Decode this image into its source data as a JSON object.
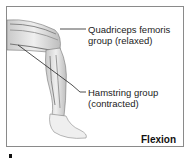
{
  "figure": {
    "labels": [
      {
        "line1": "Quadriceps femoris",
        "line2": "group (relaxed)"
      },
      {
        "line1": "Hamstring group",
        "line2": "(contracted)"
      }
    ],
    "caption": "Flexion"
  }
}
